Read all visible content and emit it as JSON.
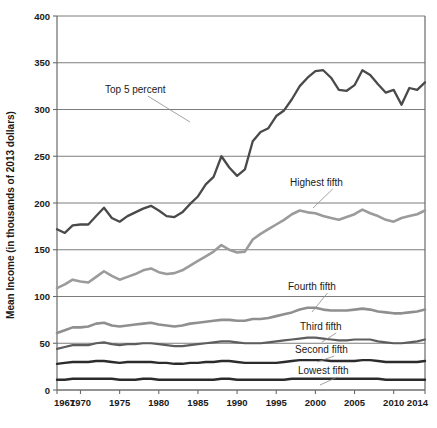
{
  "chart_data": {
    "type": "line",
    "title": "",
    "xlabel": "",
    "ylabel": "Mean Income (in thousands of 2013 dollars)",
    "xlim": [
      1967,
      2014
    ],
    "ylim": [
      0,
      400
    ],
    "yticks": [
      0,
      50,
      100,
      150,
      200,
      250,
      300,
      350,
      400
    ],
    "ytick_labels": [
      "0",
      "50",
      "100",
      "150",
      "200",
      "250",
      "300",
      "350",
      "400"
    ],
    "xticks": [
      1967,
      1970,
      1975,
      1980,
      1985,
      1990,
      1995,
      2000,
      2005,
      2010,
      2014
    ],
    "xtick_labels": [
      "1967",
      "1970",
      "1975",
      "1980",
      "1985",
      "1990",
      "1995",
      "2000",
      "2005",
      "2010",
      "2014"
    ],
    "grid": "horizontal",
    "legend_position": "inline-annotations",
    "x": [
      1967,
      1968,
      1969,
      1970,
      1971,
      1972,
      1973,
      1974,
      1975,
      1976,
      1977,
      1978,
      1979,
      1980,
      1981,
      1982,
      1983,
      1984,
      1985,
      1986,
      1987,
      1988,
      1989,
      1990,
      1991,
      1992,
      1993,
      1994,
      1995,
      1996,
      1997,
      1998,
      1999,
      2000,
      2001,
      2002,
      2003,
      2004,
      2005,
      2006,
      2007,
      2008,
      2009,
      2010,
      2011,
      2012,
      2013,
      2014
    ],
    "series": [
      {
        "name": "Top 5 percent",
        "color": "#4a4a4a",
        "width": 2.3,
        "values": [
          172,
          168,
          176,
          177,
          177,
          186,
          195,
          184,
          180,
          186,
          190,
          194,
          197,
          192,
          186,
          185,
          190,
          199,
          207,
          220,
          228,
          250,
          238,
          229,
          236,
          266,
          276,
          280,
          293,
          299,
          311,
          325,
          334,
          341,
          342,
          334,
          321,
          320,
          326,
          342,
          337,
          327,
          318,
          321,
          305,
          323,
          321,
          329
        ]
      },
      {
        "name": "Highest fifth",
        "color": "#9b9b9b",
        "width": 2.6,
        "values": [
          109,
          113,
          118,
          116,
          115,
          121,
          127,
          122,
          118,
          121,
          124,
          128,
          130,
          126,
          124,
          125,
          128,
          133,
          138,
          143,
          148,
          155,
          150,
          147,
          148,
          161,
          167,
          172,
          177,
          182,
          188,
          192,
          190,
          189,
          186,
          184,
          182,
          185,
          188,
          193,
          189,
          186,
          182,
          180,
          184,
          186,
          188,
          192
        ]
      },
      {
        "name": "Fourth fifth",
        "color": "#8f8f8f",
        "width": 2.6,
        "values": [
          61,
          64,
          67,
          67,
          68,
          71,
          72,
          69,
          68,
          69,
          70,
          71,
          72,
          70,
          69,
          68,
          69,
          71,
          72,
          73,
          74,
          75,
          75,
          74,
          74,
          76,
          76,
          77,
          79,
          81,
          83,
          86,
          88,
          88,
          86,
          85,
          85,
          85,
          86,
          87,
          86,
          84,
          83,
          82,
          82,
          83,
          84,
          86
        ]
      },
      {
        "name": "Third fifth",
        "color": "#5e5e5e",
        "width": 2.2,
        "values": [
          44,
          46,
          48,
          48,
          48,
          50,
          51,
          49,
          48,
          49,
          49,
          50,
          50,
          49,
          48,
          47,
          47,
          48,
          49,
          50,
          51,
          52,
          52,
          51,
          50,
          50,
          50,
          51,
          52,
          53,
          54,
          55,
          56,
          56,
          55,
          54,
          53,
          53,
          54,
          54,
          54,
          52,
          51,
          50,
          50,
          51,
          52,
          54
        ]
      },
      {
        "name": "Second fifth",
        "color": "#2b2b2b",
        "width": 2.4,
        "values": [
          28,
          29,
          30,
          30,
          30,
          31,
          31,
          30,
          29,
          30,
          30,
          30,
          30,
          29,
          29,
          28,
          28,
          29,
          29,
          30,
          30,
          31,
          31,
          30,
          29,
          29,
          29,
          29,
          29,
          30,
          31,
          32,
          32,
          32,
          32,
          31,
          31,
          31,
          31,
          32,
          32,
          31,
          30,
          30,
          30,
          30,
          30,
          31
        ]
      },
      {
        "name": "Lowest fifth",
        "color": "#2b2b2b",
        "width": 2.4,
        "values": [
          11,
          11,
          12,
          12,
          12,
          12,
          12,
          12,
          11,
          11,
          11,
          12,
          12,
          11,
          11,
          11,
          11,
          11,
          11,
          11,
          11,
          12,
          12,
          11,
          11,
          11,
          11,
          11,
          11,
          11,
          12,
          12,
          12,
          12,
          12,
          12,
          12,
          12,
          12,
          12,
          12,
          12,
          11,
          11,
          11,
          11,
          11,
          11
        ]
      }
    ],
    "annotations": [
      {
        "text": "Top 5 percent",
        "x": 105,
        "y": 93
      },
      {
        "text": "Highest fifth",
        "x": 290,
        "y": 186
      },
      {
        "text": "Fourth fifth",
        "x": 288,
        "y": 290
      },
      {
        "text": "Third fifth",
        "x": 300,
        "y": 330
      },
      {
        "text": "Second fifth",
        "x": 295,
        "y": 353
      },
      {
        "text": "Lowest fifth",
        "x": 298,
        "y": 374
      }
    ]
  }
}
